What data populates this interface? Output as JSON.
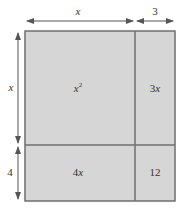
{
  "diagram": {
    "type": "area-model-rectangle",
    "colors": {
      "fill": "#d6d6d6",
      "border": "#6e6e6e",
      "divider": "#6e6e6e",
      "arrow": "#555555",
      "text": "#333333"
    },
    "dimensions": {
      "top": [
        {
          "label": "x",
          "italic": true
        },
        {
          "label": "3",
          "italic": false
        }
      ],
      "left": [
        {
          "label": "x",
          "italic": true
        },
        {
          "label": "4",
          "italic": false
        }
      ]
    },
    "cells": {
      "top_left": {
        "base": "x",
        "sup": "2"
      },
      "top_right": {
        "coef": "3",
        "var": "x"
      },
      "bottom_left": {
        "coef": "4",
        "var": "x"
      },
      "bottom_right": {
        "value": "12"
      }
    }
  }
}
